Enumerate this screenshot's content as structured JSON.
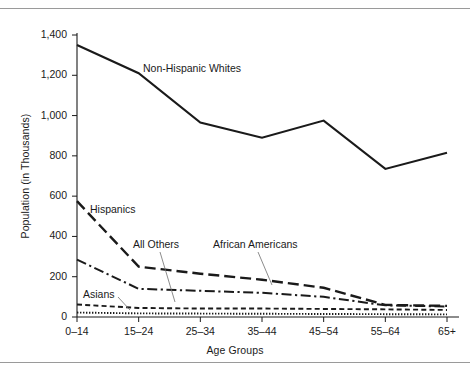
{
  "figure": {
    "y_axis_title": "Population (in Thousands)",
    "x_axis_title": "Age Groups"
  },
  "chart_data": {
    "type": "line",
    "title": "",
    "xlabel": "Age Groups",
    "ylabel": "Population (in Thousands)",
    "categories": [
      "0–14",
      "15–24",
      "25–34",
      "35–44",
      "45–54",
      "55–64",
      "65+"
    ],
    "ytick_labels": [
      "0",
      "200",
      "400",
      "600",
      "800",
      "1,000",
      "1,200",
      "1,400"
    ],
    "ytick_values": [
      0,
      200,
      400,
      600,
      800,
      1000,
      1200,
      1400
    ],
    "ylim": [
      0,
      1400
    ],
    "grid": false,
    "legend": "inline-labels",
    "series": [
      {
        "name": "Non-Hispanic Whites",
        "style": "solid",
        "color": "#1a1a1a",
        "values": [
          1350,
          1210,
          965,
          890,
          975,
          735,
          815
        ],
        "label_x": 143,
        "label_y": 62
      },
      {
        "name": "Hispanics",
        "style": "long-dash",
        "color": "#1a1a1a",
        "values": [
          575,
          250,
          215,
          185,
          145,
          60,
          55
        ],
        "label_x": 90,
        "label_y": 203
      },
      {
        "name": "African Americans",
        "style": "dash-dot",
        "color": "#1a1a1a",
        "values": [
          285,
          140,
          130,
          120,
          100,
          58,
          52
        ],
        "label_x": 213,
        "label_y": 238
      },
      {
        "name": "All Others",
        "style": "short-dash",
        "color": "#1a1a1a",
        "values": [
          62,
          45,
          42,
          42,
          40,
          38,
          35
        ],
        "label_x": 133,
        "label_y": 238
      },
      {
        "name": "Asians",
        "style": "dotted",
        "color": "#1a1a1a",
        "values": [
          22,
          18,
          17,
          16,
          15,
          14,
          13
        ],
        "label_x": 83,
        "label_y": 288
      }
    ]
  }
}
